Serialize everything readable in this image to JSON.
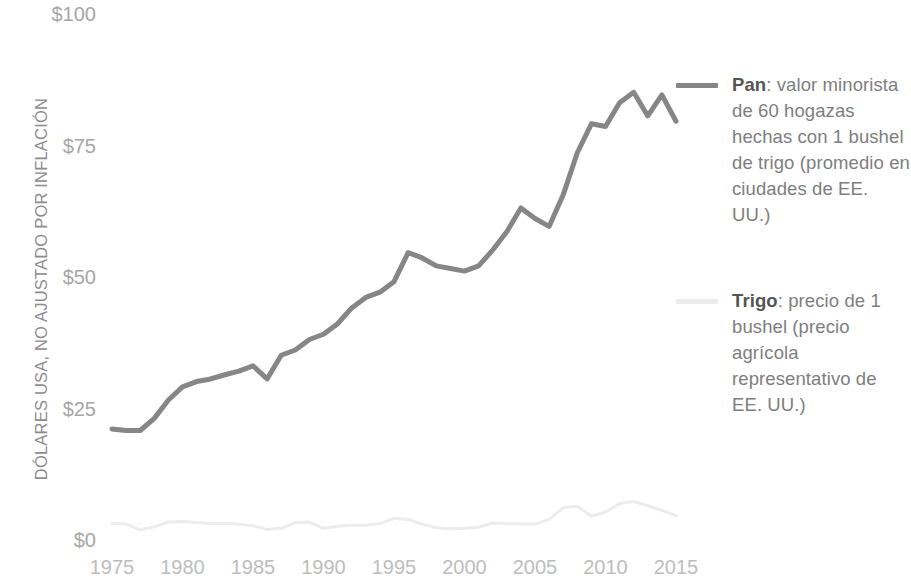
{
  "chart_data": {
    "type": "line",
    "title": "",
    "subtitle": "",
    "xlabel": "",
    "ylabel": "DÓLARES USA, NO AJUSTADO POR INFLACIÓN",
    "xlim": [
      1974,
      2016
    ],
    "ylim": [
      0,
      100
    ],
    "grid": false,
    "legend_position": "right",
    "x_ticks": [
      "1975",
      "1980",
      "1985",
      "1990",
      "1995",
      "2000",
      "2005",
      "2010",
      "2015"
    ],
    "x_tick_values": [
      1975,
      1980,
      1985,
      1990,
      1995,
      2000,
      2005,
      2010,
      2015
    ],
    "y_ticks": [
      "$0",
      "$25",
      "$50",
      "$75",
      "$100"
    ],
    "y_tick_values": [
      0,
      25,
      50,
      75,
      100
    ],
    "x": [
      1975,
      1976,
      1977,
      1978,
      1979,
      1980,
      1981,
      1982,
      1983,
      1984,
      1985,
      1986,
      1987,
      1988,
      1989,
      1990,
      1991,
      1992,
      1993,
      1994,
      1995,
      1996,
      1997,
      1998,
      1999,
      2000,
      2001,
      2002,
      2003,
      2004,
      2005,
      2006,
      2007,
      2008,
      2009,
      2010,
      2011,
      2012,
      2013,
      2014,
      2015
    ],
    "series": [
      {
        "name": "Pan",
        "color": "#868686",
        "width": 5,
        "label_bold": "Pan",
        "label_rest": ": valor minorista de 60 hogazas hechas con 1 bushel de trigo (promedio en ciudades de EE. UU.)",
        "values": [
          21.5,
          21.2,
          21.2,
          23.5,
          27.0,
          29.5,
          30.5,
          31.0,
          31.8,
          32.5,
          33.5,
          31.0,
          35.5,
          36.5,
          38.5,
          39.5,
          41.5,
          44.5,
          46.5,
          47.5,
          49.5,
          55.0,
          54.0,
          52.5,
          52.0,
          51.5,
          52.5,
          55.5,
          59.0,
          63.5,
          61.5,
          60.0,
          66.0,
          74.0,
          79.5,
          79.0,
          83.5,
          85.5,
          81.0,
          85.0,
          80.0
        ]
      },
      {
        "name": "Trigo",
        "color": "#ececec",
        "width": 3,
        "label_bold": "Trigo",
        "label_rest": ": precio de 1 bushel (precio agrícola representativo de EE. UU.)",
        "values": [
          3.5,
          3.4,
          2.3,
          2.9,
          3.8,
          3.9,
          3.7,
          3.5,
          3.5,
          3.4,
          3.1,
          2.4,
          2.6,
          3.7,
          3.8,
          2.6,
          3.0,
          3.2,
          3.2,
          3.5,
          4.5,
          4.3,
          3.4,
          2.7,
          2.5,
          2.6,
          2.8,
          3.6,
          3.5,
          3.4,
          3.4,
          4.3,
          6.5,
          6.8,
          4.9,
          5.7,
          7.3,
          7.7,
          6.9,
          6.0,
          5.0
        ]
      }
    ]
  },
  "axis": {
    "y_title": "DÓLARES USA, NO AJUSTADO POR INFLACIÓN"
  },
  "legend": {
    "entries": [
      {
        "key": "pan",
        "bold": "Pan",
        "text": ": valor minorista de 60 hogazas hechas con 1 bushel de trigo (promedio en ciudades de EE. UU.)",
        "color": "#868686"
      },
      {
        "key": "trigo",
        "bold": "Trigo",
        "text": ": precio de 1 bushel (precio agrícola representativo de EE. UU.)",
        "color": "#ececec"
      }
    ]
  },
  "colors": {
    "background": "#ffffff",
    "pan_line": "#868686",
    "trigo_line": "#ececec",
    "axis_text": "#a6a6a6",
    "x_tick_text": "#bdbdbd",
    "y_title_text": "#8d8d8d",
    "legend_text": "#7e7e7e",
    "legend_bold": "#555555"
  }
}
